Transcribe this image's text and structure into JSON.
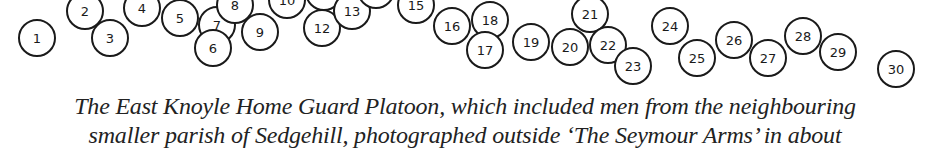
{
  "diagram": {
    "type": "photo-identification-key",
    "circles": [
      {
        "n": "1",
        "x": 37,
        "y": 38
      },
      {
        "n": "2",
        "x": 85,
        "y": 11
      },
      {
        "n": "3",
        "x": 110,
        "y": 38
      },
      {
        "n": "4",
        "x": 142,
        "y": 8
      },
      {
        "n": "5",
        "x": 180,
        "y": 18
      },
      {
        "n": "7",
        "x": 217,
        "y": 25
      },
      {
        "n": "6",
        "x": 213,
        "y": 48
      },
      {
        "n": "8",
        "x": 235,
        "y": 5
      },
      {
        "n": "9",
        "x": 260,
        "y": 32
      },
      {
        "n": "10",
        "x": 287,
        "y": 0
      },
      {
        "n": "11",
        "x": 324,
        "y": -8
      },
      {
        "n": "12",
        "x": 322,
        "y": 28
      },
      {
        "n": "13",
        "x": 352,
        "y": 11
      },
      {
        "n": "14",
        "x": 376,
        "y": -10
      },
      {
        "n": "15",
        "x": 416,
        "y": 5
      },
      {
        "n": "16",
        "x": 452,
        "y": 26
      },
      {
        "n": "18",
        "x": 490,
        "y": 20
      },
      {
        "n": "17",
        "x": 485,
        "y": 50
      },
      {
        "n": "19",
        "x": 531,
        "y": 42
      },
      {
        "n": "21",
        "x": 590,
        "y": 14
      },
      {
        "n": "20",
        "x": 570,
        "y": 47
      },
      {
        "n": "22",
        "x": 608,
        "y": 45
      },
      {
        "n": "23",
        "x": 633,
        "y": 66
      },
      {
        "n": "24",
        "x": 670,
        "y": 26
      },
      {
        "n": "25",
        "x": 697,
        "y": 58
      },
      {
        "n": "26",
        "x": 734,
        "y": 40
      },
      {
        "n": "27",
        "x": 768,
        "y": 58
      },
      {
        "n": "28",
        "x": 803,
        "y": 36
      },
      {
        "n": "29",
        "x": 838,
        "y": 52
      },
      {
        "n": "30",
        "x": 896,
        "y": 69
      }
    ]
  },
  "caption": {
    "line1": "The East Knoyle Home Guard Platoon, which included men from the neighbouring",
    "line2": "smaller parish of Sedgehill, photographed outside ‘The Seymour Arms’ in about"
  }
}
